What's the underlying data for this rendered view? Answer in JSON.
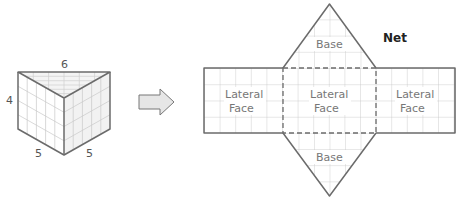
{
  "prism": {
    "dimensions": {
      "top_edge": "6",
      "height": "4",
      "bottom_left": "5",
      "bottom_right": "5"
    }
  },
  "arrow": {
    "icon": "right-arrow-icon",
    "fill": "#e6e6e6",
    "stroke": "#777777"
  },
  "net": {
    "title": "Net",
    "faces": {
      "base_top": "Base",
      "base_bottom": "Base",
      "left_line1": "Lateral",
      "left_line2": "Face",
      "middle_line1": "Lateral",
      "middle_line2": "Face",
      "right_line1": "Lateral",
      "right_line2": "Face"
    }
  },
  "colors": {
    "outline": "#6b6b6b",
    "grid": "#c4c4c4",
    "shade": "#efefef"
  }
}
